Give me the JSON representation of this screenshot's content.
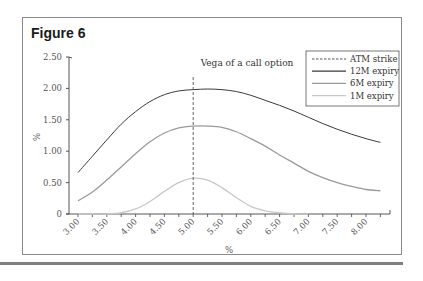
{
  "figure": {
    "label": "Figure 6"
  },
  "chart_data": {
    "type": "line",
    "title": "Vega of a call option",
    "xlabel": "%",
    "ylabel": "%",
    "xlim": [
      2.85,
      8.4
    ],
    "ylim": [
      0,
      2.5
    ],
    "x_ticks": [
      "3.00",
      "3.50",
      "4.00",
      "4.50",
      "5.00",
      "5.50",
      "6.00",
      "6.50",
      "7.00",
      "7.50",
      "8.00"
    ],
    "y_ticks": [
      "0",
      "0.50",
      "1.00",
      "1.50",
      "2.00",
      "2.50"
    ],
    "grid": false,
    "legend_position": "upper right",
    "vertical_line": {
      "name": "ATM strike",
      "x": 5.0,
      "style": "dashed"
    },
    "x": [
      3.0,
      3.25,
      3.5,
      3.75,
      4.0,
      4.25,
      4.5,
      4.75,
      5.0,
      5.25,
      5.5,
      5.75,
      6.0,
      6.25,
      6.5,
      6.75,
      7.0,
      7.25,
      7.5,
      7.75,
      8.0,
      8.25
    ],
    "series": [
      {
        "name": "12M expiry",
        "color": "#3a3a3a",
        "values": [
          0.66,
          0.92,
          1.18,
          1.43,
          1.63,
          1.79,
          1.9,
          1.96,
          1.98,
          1.99,
          1.98,
          1.95,
          1.89,
          1.81,
          1.73,
          1.64,
          1.54,
          1.44,
          1.35,
          1.27,
          1.2,
          1.14
        ]
      },
      {
        "name": "6M expiry",
        "color": "#9a9a9a",
        "values": [
          0.21,
          0.35,
          0.54,
          0.75,
          0.96,
          1.15,
          1.29,
          1.37,
          1.4,
          1.4,
          1.38,
          1.31,
          1.2,
          1.08,
          0.94,
          0.81,
          0.68,
          0.58,
          0.5,
          0.44,
          0.39,
          0.37
        ]
      },
      {
        "name": "1M expiry",
        "color": "#c8c8c8",
        "values": [
          0.0,
          0.0,
          0.0,
          0.02,
          0.08,
          0.2,
          0.36,
          0.5,
          0.57,
          0.54,
          0.42,
          0.26,
          0.12,
          0.05,
          0.02,
          0.0,
          0.0,
          null,
          null,
          null,
          null,
          null
        ]
      }
    ]
  },
  "legend": {
    "items": [
      {
        "label": "ATM strike",
        "style": "dashed",
        "color": "#444444"
      },
      {
        "label": "12M expiry",
        "style": "solid",
        "color": "#3a3a3a"
      },
      {
        "label": "6M expiry",
        "style": "solid",
        "color": "#9a9a9a"
      },
      {
        "label": "1M expiry",
        "style": "solid",
        "color": "#c8c8c8"
      }
    ]
  }
}
